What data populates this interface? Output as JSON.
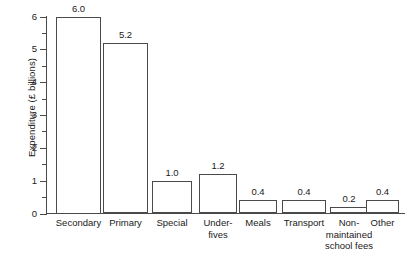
{
  "chart_data": {
    "type": "bar",
    "title": "",
    "xlabel": "",
    "ylabel": "Expenditure (£ billions)",
    "ylim": [
      0,
      6
    ],
    "ytick_labels": [
      "0",
      "1",
      "2",
      "3",
      "4",
      "5",
      "6"
    ],
    "ytick_values": [
      0,
      1,
      2,
      3,
      4,
      5,
      6
    ],
    "yminor_values": [
      0.5,
      1.5,
      2.5,
      3.5,
      4.5,
      5.5
    ],
    "grid": false,
    "legend": null,
    "bar_face_color": "#ffffff",
    "bar_edge_color": "#4a4a4a",
    "axis_color": "#4a4a4a",
    "text_color": "#1a1a1a",
    "categories": [
      "Secondary",
      "Primary",
      "Special",
      "Under-\nfives",
      "Meals",
      "Transport",
      "Non-\nmaintained\nschool fees",
      "Other"
    ],
    "values": [
      6.0,
      5.2,
      1.0,
      1.2,
      0.4,
      0.4,
      0.2,
      0.4
    ],
    "value_labels": [
      "6.0",
      "5.2",
      "1.0",
      "1.2",
      "0.4",
      "0.4",
      "0.2",
      "0.4"
    ]
  }
}
